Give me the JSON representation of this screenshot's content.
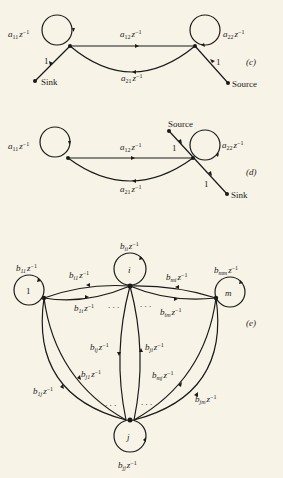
{
  "figures": [
    {
      "id": "c",
      "tag": "(c)",
      "labels": {
        "self1": {
          "var": "a",
          "sub": "11",
          "rest": "z",
          "sup": "−1"
        },
        "self2": {
          "var": "a",
          "sub": "22",
          "rest": "z",
          "sup": "−1"
        },
        "e12": {
          "var": "a",
          "sub": "12",
          "rest": "z",
          "sup": "−1"
        },
        "e21": {
          "var": "a",
          "sub": "21",
          "rest": "z",
          "sup": "−1"
        },
        "sink_gain": "1",
        "source_gain": "1",
        "sink": "Sink",
        "source": "Source"
      }
    },
    {
      "id": "d",
      "tag": "(d)",
      "labels": {
        "self1": {
          "var": "a",
          "sub": "11",
          "rest": "z",
          "sup": "−1"
        },
        "self2": {
          "var": "a",
          "sub": "22",
          "rest": "z",
          "sup": "−1"
        },
        "e12": {
          "var": "a",
          "sub": "12",
          "rest": "z",
          "sup": "−1"
        },
        "e21": {
          "var": "a",
          "sub": "21",
          "rest": "z",
          "sup": "−1"
        },
        "source_gain": "1",
        "sink_gain": "1",
        "source": "Source",
        "sink": "Sink"
      }
    },
    {
      "id": "e",
      "tag": "(e)",
      "nodes": {
        "n1": "1",
        "ni": "i",
        "nm": "m",
        "nj": "j"
      },
      "labels": {
        "b11": {
          "var": "b",
          "sub": "11",
          "rest": "z",
          "sup": "−1"
        },
        "bii": {
          "var": "b",
          "sub": "ii",
          "rest": "z",
          "sup": "−1"
        },
        "bmm": {
          "var": "b",
          "sub": "mm",
          "rest": "z",
          "sup": "−1"
        },
        "bjj": {
          "var": "b",
          "sub": "jj",
          "rest": "z",
          "sup": "−1"
        },
        "bi1": {
          "var": "b",
          "sub": "i1",
          "rest": "z",
          "sup": "−1"
        },
        "b1i": {
          "var": "b",
          "sub": "1i",
          "rest": "z",
          "sup": "−1"
        },
        "bmi": {
          "var": "b",
          "sub": "mi",
          "rest": "z",
          "sup": "−1"
        },
        "bim": {
          "var": "b",
          "sub": "im",
          "rest": "z",
          "sup": "−1"
        },
        "bij": {
          "var": "b",
          "sub": "ij",
          "rest": "z",
          "sup": "−1"
        },
        "bji": {
          "var": "b",
          "sub": "ji",
          "rest": "z",
          "sup": "−1"
        },
        "bj1": {
          "var": "b",
          "sub": "j1",
          "rest": "z",
          "sup": "−1"
        },
        "b1j": {
          "var": "b",
          "sub": "1j",
          "rest": "z",
          "sup": "−1"
        },
        "bmj": {
          "var": "b",
          "sub": "mj",
          "rest": "z",
          "sup": "−1"
        },
        "bjm": {
          "var": "b",
          "sub": "jm",
          "rest": "z",
          "sup": "−1"
        }
      }
    }
  ]
}
